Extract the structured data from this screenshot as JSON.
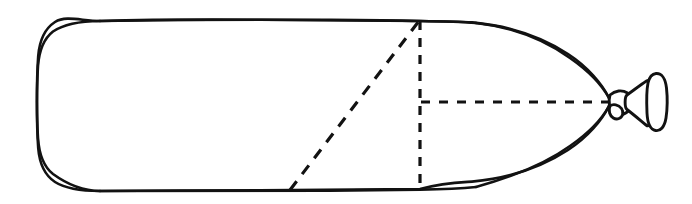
{
  "figure": {
    "title": "Balloon outline line drawing with dashed construction lines",
    "background_color": "#ffffff",
    "stroke_color": "#121212",
    "width": 692,
    "height": 204,
    "parts": {
      "body_label": "balloon-body",
      "nozzle_label": "balloon-nozzle",
      "vertical_guide_label": "vertical-dashed-guide",
      "horizontal_guide_label": "horizontal-axis-dashed-guide",
      "diagonal_guide_label": "diagonal-dashed-guide"
    }
  },
  "chart_data": {
    "type": "line",
    "title": "Balloon outline line drawing with dashed construction lines",
    "xlabel": "",
    "ylabel": "",
    "xlim": [
      0,
      692
    ],
    "ylim": [
      204,
      0
    ],
    "grid": false,
    "legend": "none",
    "series": [
      {
        "name": "balloon-body-outline",
        "kind": "closed-path",
        "style": "solid",
        "points": [
          [
            100,
            21
          ],
          [
            250,
            20
          ],
          [
            360,
            20
          ],
          [
            420,
            21
          ],
          [
            470,
            22
          ],
          [
            520,
            30
          ],
          [
            560,
            48
          ],
          [
            590,
            72
          ],
          [
            606,
            95
          ],
          [
            610,
            102
          ],
          [
            606,
            112
          ],
          [
            590,
            134
          ],
          [
            560,
            156
          ],
          [
            520,
            174
          ],
          [
            470,
            184
          ],
          [
            420,
            189
          ],
          [
            360,
            190
          ],
          [
            250,
            191
          ],
          [
            140,
            191
          ],
          [
            100,
            191
          ],
          [
            70,
            187
          ],
          [
            50,
            175
          ],
          [
            40,
            155
          ],
          [
            37,
            125
          ],
          [
            37,
            102
          ],
          [
            37,
            80
          ],
          [
            40,
            52
          ],
          [
            52,
            33
          ],
          [
            72,
            24
          ],
          [
            100,
            21
          ]
        ]
      },
      {
        "name": "nozzle-neck",
        "kind": "closed-path",
        "style": "solid",
        "points": [
          [
            610,
            96
          ],
          [
            618,
            92
          ],
          [
            626,
            94
          ],
          [
            630,
            100
          ],
          [
            630,
            108
          ],
          [
            624,
            114
          ],
          [
            615,
            113
          ],
          [
            610,
            108
          ]
        ]
      },
      {
        "name": "nozzle-flare",
        "kind": "closed-path",
        "style": "solid",
        "points": [
          [
            626,
            96
          ],
          [
            640,
            86
          ],
          [
            646,
            82
          ],
          [
            648,
            92
          ],
          [
            648,
            116
          ],
          [
            645,
            124
          ],
          [
            636,
            118
          ],
          [
            626,
            110
          ]
        ]
      },
      {
        "name": "nozzle-ring",
        "kind": "closed-path",
        "style": "solid",
        "points": [
          [
            650,
            78
          ],
          [
            658,
            74
          ],
          [
            664,
            80
          ],
          [
            665,
            96
          ],
          [
            664,
            112
          ],
          [
            660,
            126
          ],
          [
            652,
            128
          ],
          [
            648,
            118
          ],
          [
            647,
            98
          ],
          [
            648,
            84
          ]
        ]
      },
      {
        "name": "vertical-dashed-guide",
        "kind": "segment",
        "style": "dashed",
        "dash_pattern": [
          9,
          8
        ],
        "points": [
          [
            420,
            21
          ],
          [
            420,
            190
          ]
        ]
      },
      {
        "name": "horizontal-axis-dashed-guide",
        "kind": "segment",
        "style": "dashed",
        "dash_pattern": [
          9,
          9
        ],
        "points": [
          [
            421,
            102
          ],
          [
            612,
            102
          ]
        ]
      },
      {
        "name": "diagonal-dashed-guide",
        "kind": "segment",
        "style": "dashed",
        "dash_pattern": [
          11,
          9
        ],
        "points": [
          [
            290,
            190
          ],
          [
            419,
            21
          ]
        ]
      }
    ],
    "annotations": []
  }
}
